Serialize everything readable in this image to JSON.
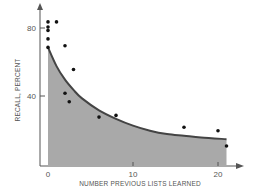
{
  "chart_data": {
    "type": "scatter",
    "title": "",
    "xlabel": "NUMBER PREVIOUS LISTS LEARNED",
    "ylabel": "RECALL, PERCENT",
    "xlim": [
      0,
      22
    ],
    "ylim": [
      0,
      90
    ],
    "x_ticks": [
      "0",
      "10",
      "20"
    ],
    "y_ticks": [
      "40",
      "80"
    ],
    "grid": false,
    "legend": null,
    "series": [
      {
        "name": "observed",
        "type": "scatter",
        "points": [
          {
            "x": 0,
            "y": 83
          },
          {
            "x": 0,
            "y": 80
          },
          {
            "x": 0,
            "y": 78
          },
          {
            "x": 0,
            "y": 73
          },
          {
            "x": 0,
            "y": 68
          },
          {
            "x": 1,
            "y": 83
          },
          {
            "x": 2,
            "y": 69
          },
          {
            "x": 2,
            "y": 41
          },
          {
            "x": 2.5,
            "y": 36
          },
          {
            "x": 3,
            "y": 55
          },
          {
            "x": 6,
            "y": 27
          },
          {
            "x": 8,
            "y": 28
          },
          {
            "x": 16,
            "y": 21
          },
          {
            "x": 20,
            "y": 19
          },
          {
            "x": 21,
            "y": 10
          }
        ]
      },
      {
        "name": "fitted curve (shaded)",
        "type": "area",
        "points": [
          {
            "x": 0,
            "y": 68
          },
          {
            "x": 1,
            "y": 57
          },
          {
            "x": 2,
            "y": 49
          },
          {
            "x": 3,
            "y": 43
          },
          {
            "x": 4,
            "y": 38
          },
          {
            "x": 6,
            "y": 31
          },
          {
            "x": 8,
            "y": 26
          },
          {
            "x": 10,
            "y": 22
          },
          {
            "x": 12,
            "y": 19
          },
          {
            "x": 14,
            "y": 17
          },
          {
            "x": 16,
            "y": 16
          },
          {
            "x": 18,
            "y": 15
          },
          {
            "x": 21,
            "y": 14
          }
        ]
      }
    ],
    "colors": {
      "fill": "#a8a8a8",
      "curve": "#444444",
      "points": "#111111",
      "axis": "#555555"
    }
  }
}
